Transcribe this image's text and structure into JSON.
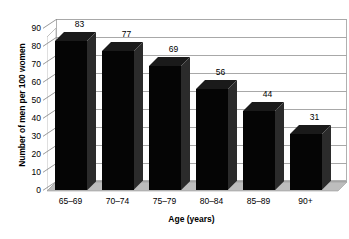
{
  "chart_data": {
    "type": "bar",
    "title": "",
    "categories": [
      "65–69",
      "70–74",
      "75–79",
      "80–84",
      "85–89",
      "90+"
    ],
    "values": [
      83,
      77,
      69,
      56,
      44,
      31
    ],
    "data_labels": [
      "83",
      "77",
      "69",
      "56",
      "44",
      "31"
    ],
    "xlabel": "Age (years)",
    "ylabel": "Number of men per 100 women",
    "ylim": [
      0,
      90
    ],
    "ytick_labels": [
      "0",
      "10",
      "20",
      "30",
      "40",
      "50",
      "60",
      "70",
      "80",
      "90"
    ],
    "ytick_values": [
      0,
      10,
      20,
      30,
      40,
      50,
      60,
      70,
      80,
      90
    ],
    "grid": true,
    "legend": "none",
    "style": "3d-column",
    "colors": {
      "bar": "#050505",
      "bar_top": "#1a1a1a",
      "bar_side": "#2b2b2b",
      "floor": "#7d7d7d",
      "floor_light": "#bdbdbd",
      "gridline": "#a8a8a8",
      "plot_border": "#b0b0b0",
      "text": "#000000",
      "background": "#ffffff"
    }
  }
}
